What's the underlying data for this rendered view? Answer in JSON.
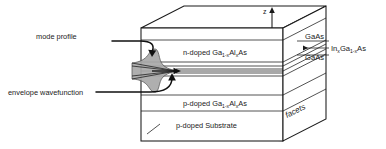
{
  "figure": {
    "axis": {
      "z_label": "z"
    },
    "layers": [
      {
        "id": "n-cladding",
        "prefix": "n-doped Ga",
        "sub1": "1-x",
        "mid": "Al",
        "sub2": "x",
        "suffix": "As",
        "text": "n-doped Ga1-xAlxAs"
      },
      {
        "id": "p-cladding",
        "prefix": "p-doped Ga",
        "sub1": "1-x",
        "mid": "Al",
        "sub2": "x",
        "suffix": "As",
        "text": "p-doped Ga1-xAlxAs"
      },
      {
        "id": "substrate",
        "text": "p-doped  Substrate"
      }
    ],
    "callouts": [
      {
        "id": "mode-profile",
        "label": "mode profile"
      },
      {
        "id": "envelope-wavefunction",
        "label": "envelope  wavefunction"
      }
    ],
    "side_labels": [
      {
        "id": "gaas-upper",
        "label": "GaAs"
      },
      {
        "id": "gaas-lower",
        "label": "GaAs"
      },
      {
        "id": "ingaas-well",
        "prefix": "In",
        "sub1": "x",
        "mid": "Ga",
        "sub2": "1-x",
        "suffix": "As",
        "text": "InxGa1-xAs"
      }
    ],
    "facets_label": "facets",
    "colors": {
      "outline": "#1a1a1a",
      "hidden_edge": "#9a9a9a",
      "mode_fill": "#a8a8a8",
      "background": "#ffffff"
    }
  }
}
